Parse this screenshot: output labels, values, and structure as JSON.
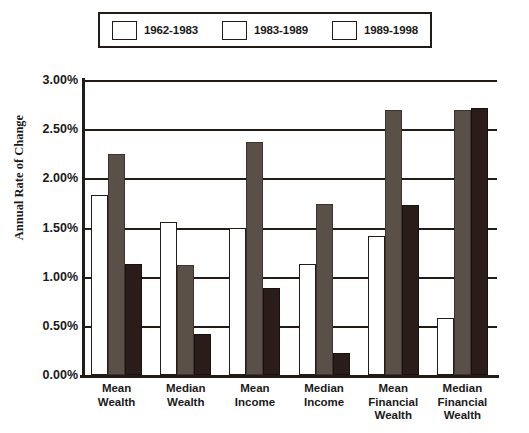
{
  "chart_data": {
    "type": "bar",
    "title": "",
    "xlabel": "",
    "ylabel": "Annual Rate of Change",
    "ylim": [
      0,
      3.0
    ],
    "ytick_labels": [
      "0.00%",
      "0.50%",
      "1.00%",
      "1.50%",
      "2.00%",
      "2.50%",
      "3.00%"
    ],
    "ytick_values": [
      0,
      0.5,
      1.0,
      1.5,
      2.0,
      2.5,
      3.0
    ],
    "grid": true,
    "legend_position": "top",
    "categories": [
      "Mean\nWealth",
      "Median\nWealth",
      "Mean\nIncome",
      "Median\nIncome",
      "Mean\nFinancial\nWealth",
      "Median\nFinancial\nWealth"
    ],
    "series": [
      {
        "name": "1962-1983",
        "color": "#ffffff",
        "values": [
          1.83,
          1.56,
          1.5,
          1.13,
          1.41,
          0.58
        ]
      },
      {
        "name": "1983-1989",
        "color": "#5a5048",
        "values": [
          2.25,
          1.12,
          2.37,
          1.74,
          2.69,
          2.7
        ]
      },
      {
        "name": "1989-1998",
        "color": "#2a1c18",
        "values": [
          1.13,
          0.42,
          0.88,
          0.22,
          1.73,
          2.72
        ]
      }
    ]
  }
}
